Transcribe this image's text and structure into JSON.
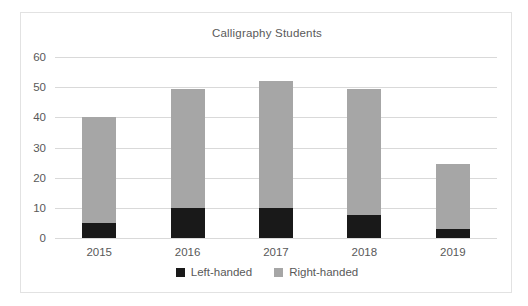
{
  "chart_data": {
    "type": "bar",
    "subtype": "stacked-vertical",
    "title": "Calligraphy Students",
    "xlabel": "",
    "ylabel": "",
    "categories": [
      "2015",
      "2016",
      "2017",
      "2018",
      "2019"
    ],
    "ylim": [
      0,
      60
    ],
    "yticks": [
      0,
      10,
      20,
      30,
      40,
      50,
      60
    ],
    "ytick_labels": [
      "0",
      "10",
      "20",
      "30",
      "40",
      "50",
      "60"
    ],
    "grid": "horizontal",
    "legend_position": "bottom",
    "series": [
      {
        "name": "Left-handed",
        "color": "#191919",
        "values": [
          5,
          10,
          10,
          7.5,
          3
        ]
      },
      {
        "name": "Right-handed",
        "color": "#a6a6a6",
        "values": [
          35,
          39.5,
          42,
          42,
          21.5
        ]
      }
    ],
    "totals": [
      40,
      49.5,
      52,
      49.5,
      24.5
    ]
  },
  "legend": {
    "items": [
      {
        "label": "Left-handed",
        "color": "#191919"
      },
      {
        "label": "Right-handed",
        "color": "#a6a6a6"
      }
    ]
  }
}
